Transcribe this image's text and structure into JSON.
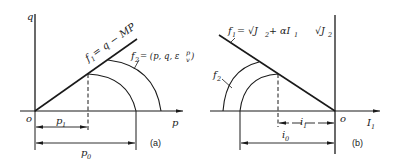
{
  "panel_a": {
    "caption": "(a)",
    "axis_y_label": "q",
    "axis_x_label": "p",
    "origin_label": "o",
    "line_label_main": "f",
    "line_label_sub": "1",
    "line_equation": "= q − MP",
    "curve_label_main": "f",
    "curve_label_sub": "2",
    "curve_equation": "= (p,  q,  ε",
    "curve_eps_sup": "p",
    "curve_eps_sub": "v",
    "curve_close": ")",
    "dim_inner_main": "p",
    "dim_inner_sub": "1",
    "dim_outer_main": "p",
    "dim_outer_sub": "0"
  },
  "panel_b": {
    "caption": "(b)",
    "axis_y_label": "√J",
    "axis_y_sub": "2",
    "axis_x_main": "I",
    "axis_x_sub": "1",
    "origin_label": "o",
    "line_label_main": "f",
    "line_label_sub": "1",
    "line_equation_a": "= √J",
    "line_equation_sub": "2",
    "line_equation_b": " + αI",
    "line_equation_sub2": "1",
    "curve_label_main": "f",
    "curve_label_sub": "2",
    "dim_inner_main": "i",
    "dim_inner_sub": "1",
    "dim_outer_main": "i",
    "dim_outer_sub": "0"
  },
  "colors": {
    "ink": "#1a1a1a",
    "background": "#ffffff"
  }
}
